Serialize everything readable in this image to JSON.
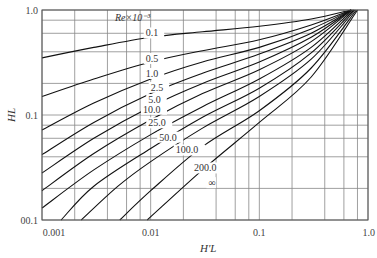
{
  "chart_data": {
    "type": "line",
    "title": "",
    "xlabel": "H'L",
    "ylabel": "HL",
    "xscale": "log",
    "yscale": "log",
    "xlim": [
      0.001,
      1.0
    ],
    "ylim": [
      0.01,
      1.0
    ],
    "grid": true,
    "x_tick_labels": [
      "0.001",
      "0.01",
      "0.1",
      "1.0"
    ],
    "y_tick_labels": [
      "00.1",
      "0.1",
      "1.0"
    ],
    "x_minor_grid": [
      0.002,
      0.004,
      0.006,
      0.008,
      0.02,
      0.04,
      0.06,
      0.08,
      0.2,
      0.4,
      0.6,
      0.8
    ],
    "y_minor_grid": [
      0.02,
      0.04,
      0.06,
      0.08,
      0.2,
      0.4,
      0.6,
      0.8
    ],
    "legend_title": "Re×10⁻³",
    "series": [
      {
        "name": "0.1",
        "label": "0.1",
        "points": [
          [
            0.001,
            0.35
          ],
          [
            0.003,
            0.44
          ],
          [
            0.01,
            0.55
          ],
          [
            0.03,
            0.62
          ],
          [
            0.1,
            0.7
          ],
          [
            0.3,
            0.82
          ],
          [
            0.7,
            1.0
          ]
        ]
      },
      {
        "name": "0.5",
        "label": "0.5",
        "points": [
          [
            0.001,
            0.15
          ],
          [
            0.003,
            0.22
          ],
          [
            0.01,
            0.32
          ],
          [
            0.03,
            0.41
          ],
          [
            0.1,
            0.52
          ],
          [
            0.3,
            0.72
          ],
          [
            0.7,
            1.0
          ]
        ]
      },
      {
        "name": "1.0",
        "label": "1.0",
        "points": [
          [
            0.001,
            0.072
          ],
          [
            0.003,
            0.13
          ],
          [
            0.01,
            0.22
          ],
          [
            0.03,
            0.32
          ],
          [
            0.1,
            0.44
          ],
          [
            0.3,
            0.66
          ],
          [
            0.7,
            1.0
          ]
        ]
      },
      {
        "name": "2.5",
        "label": "2.5",
        "points": [
          [
            0.001,
            0.042
          ],
          [
            0.003,
            0.085
          ],
          [
            0.01,
            0.16
          ],
          [
            0.03,
            0.25
          ],
          [
            0.1,
            0.38
          ],
          [
            0.3,
            0.6
          ],
          [
            0.7,
            1.0
          ]
        ]
      },
      {
        "name": "5.0",
        "label": "5.0",
        "points": [
          [
            0.001,
            0.028
          ],
          [
            0.003,
            0.06
          ],
          [
            0.01,
            0.12
          ],
          [
            0.03,
            0.2
          ],
          [
            0.1,
            0.32
          ],
          [
            0.3,
            0.55
          ],
          [
            0.7,
            1.0
          ]
        ]
      },
      {
        "name": "10.0",
        "label": "10.0",
        "points": [
          [
            0.001,
            0.019
          ],
          [
            0.003,
            0.043
          ],
          [
            0.01,
            0.09
          ],
          [
            0.03,
            0.16
          ],
          [
            0.1,
            0.27
          ],
          [
            0.3,
            0.5
          ],
          [
            0.7,
            1.0
          ]
        ]
      },
      {
        "name": "25.0",
        "label": "25.0",
        "points": [
          [
            0.001,
            0.013
          ],
          [
            0.003,
            0.03
          ],
          [
            0.01,
            0.065
          ],
          [
            0.03,
            0.12
          ],
          [
            0.1,
            0.22
          ],
          [
            0.3,
            0.44
          ],
          [
            0.72,
            1.0
          ]
        ]
      },
      {
        "name": "50.0",
        "label": "50.0",
        "points": [
          [
            0.0015,
            0.01
          ],
          [
            0.003,
            0.021
          ],
          [
            0.01,
            0.048
          ],
          [
            0.03,
            0.095
          ],
          [
            0.1,
            0.18
          ],
          [
            0.3,
            0.39
          ],
          [
            0.74,
            1.0
          ]
        ]
      },
      {
        "name": "100.0",
        "label": "100.0",
        "points": [
          [
            0.0023,
            0.01
          ],
          [
            0.005,
            0.021
          ],
          [
            0.01,
            0.036
          ],
          [
            0.03,
            0.075
          ],
          [
            0.1,
            0.15
          ],
          [
            0.3,
            0.34
          ],
          [
            0.76,
            1.0
          ]
        ]
      },
      {
        "name": "200.0",
        "label": "200.0",
        "points": [
          [
            0.0052,
            0.01
          ],
          [
            0.01,
            0.019
          ],
          [
            0.03,
            0.05
          ],
          [
            0.1,
            0.11
          ],
          [
            0.3,
            0.28
          ],
          [
            0.78,
            1.0
          ]
        ]
      },
      {
        "name": "∞",
        "label": "∞",
        "points": [
          [
            0.0093,
            0.01
          ],
          [
            0.03,
            0.03
          ],
          [
            0.1,
            0.085
          ],
          [
            0.3,
            0.23
          ],
          [
            0.8,
            1.0
          ]
        ]
      }
    ]
  }
}
